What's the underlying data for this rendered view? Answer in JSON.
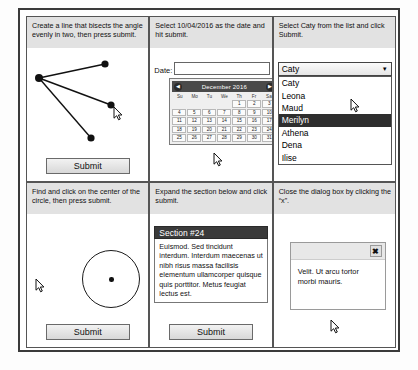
{
  "panels": {
    "angle": {
      "instruction": "Create a line that bisects the angle evenly in two, then press submit.",
      "submit_label": "Submit"
    },
    "datepicker": {
      "instruction": "Select 10/04/2016 as the date and hit submit.",
      "date_label": "Date:",
      "date_value": "",
      "date_placeholder": "",
      "calendar": {
        "month_title": "December 2016",
        "prev_icon": "◀",
        "next_icon": "▶",
        "day_names": [
          "Su",
          "Mo",
          "Tu",
          "We",
          "Th",
          "Fr",
          "Sa"
        ],
        "leading_blanks": 4,
        "days": [
          1,
          2,
          3,
          4,
          5,
          6,
          7,
          8,
          9,
          10,
          11,
          12,
          13,
          14,
          15,
          16,
          17,
          18,
          19,
          20,
          21,
          22,
          23,
          24,
          25,
          26,
          27,
          28,
          29,
          30,
          31
        ]
      }
    },
    "select": {
      "instruction": "Select Caty from the list and click Submit.",
      "selected_value": "Caty",
      "caret_icon": "▼",
      "options": [
        "Caty",
        "Leona",
        "Maud",
        "Merilyn",
        "Athena",
        "Dena",
        "Ilise"
      ],
      "highlighted_option": "Merilyn"
    },
    "circle": {
      "instruction": "Find and click on the center of the circle, then press submit.",
      "submit_label": "Submit"
    },
    "accordion": {
      "instruction": "Expand the section below and click submit.",
      "section_title": "Section #24",
      "section_body": "Euismod. Sed tincidunt interdum. Interdum maecenas ut nibh risus massa facilisis elementum ullamcorper quisque quis porttitor. Metus feugiat lectus est.",
      "submit_label": "Submit"
    },
    "dialog": {
      "instruction": "Close the dialog box by clicking the “x”.",
      "close_label": "✖",
      "body_text": "Velit. Ut arcu tortor morbi mauris."
    }
  },
  "caption": ""
}
